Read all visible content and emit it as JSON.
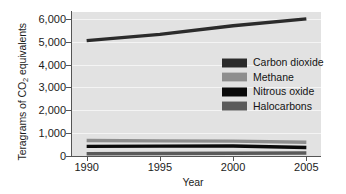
{
  "chart_data": {
    "type": "line",
    "title": "",
    "xlabel": "Year",
    "ylabel": "Teragrams of CO2 equivalents",
    "ylabel_prefix": "Teragrams of CO",
    "ylabel_sub": "2",
    "ylabel_suffix": " equivalents",
    "x": [
      1990,
      1995,
      2000,
      2005
    ],
    "xlim": [
      1989,
      2006
    ],
    "ylim": [
      0,
      6300
    ],
    "xticks": [
      "1990",
      "1995",
      "2000",
      "2005"
    ],
    "yticks": [
      "0",
      "1,000",
      "2,000",
      "3,000",
      "4,000",
      "5,000",
      "6,000"
    ],
    "ytick_values": [
      0,
      1000,
      2000,
      3000,
      4000,
      5000,
      6000
    ],
    "grid": true,
    "legend_position": "center-right",
    "series": [
      {
        "name": "Carbon dioxide",
        "color": "#2b2b2b",
        "values": [
          5050,
          5320,
          5700,
          6000
        ]
      },
      {
        "name": "Methane",
        "color": "#8e8e8e",
        "values": [
          680,
          660,
          650,
          600
        ]
      },
      {
        "name": "Nitrous oxide",
        "color": "#0a0a0a",
        "values": [
          420,
          430,
          440,
          370
        ]
      },
      {
        "name": "Halocarbons",
        "color": "#5a5a5a",
        "values": [
          100,
          110,
          120,
          130
        ]
      }
    ]
  },
  "colors": {
    "plot_background": "#e2e2e2",
    "gridline": "#f4f4f4",
    "axis": "#555555",
    "text": "#1c1c1c",
    "page_background": "#ffffff"
  }
}
